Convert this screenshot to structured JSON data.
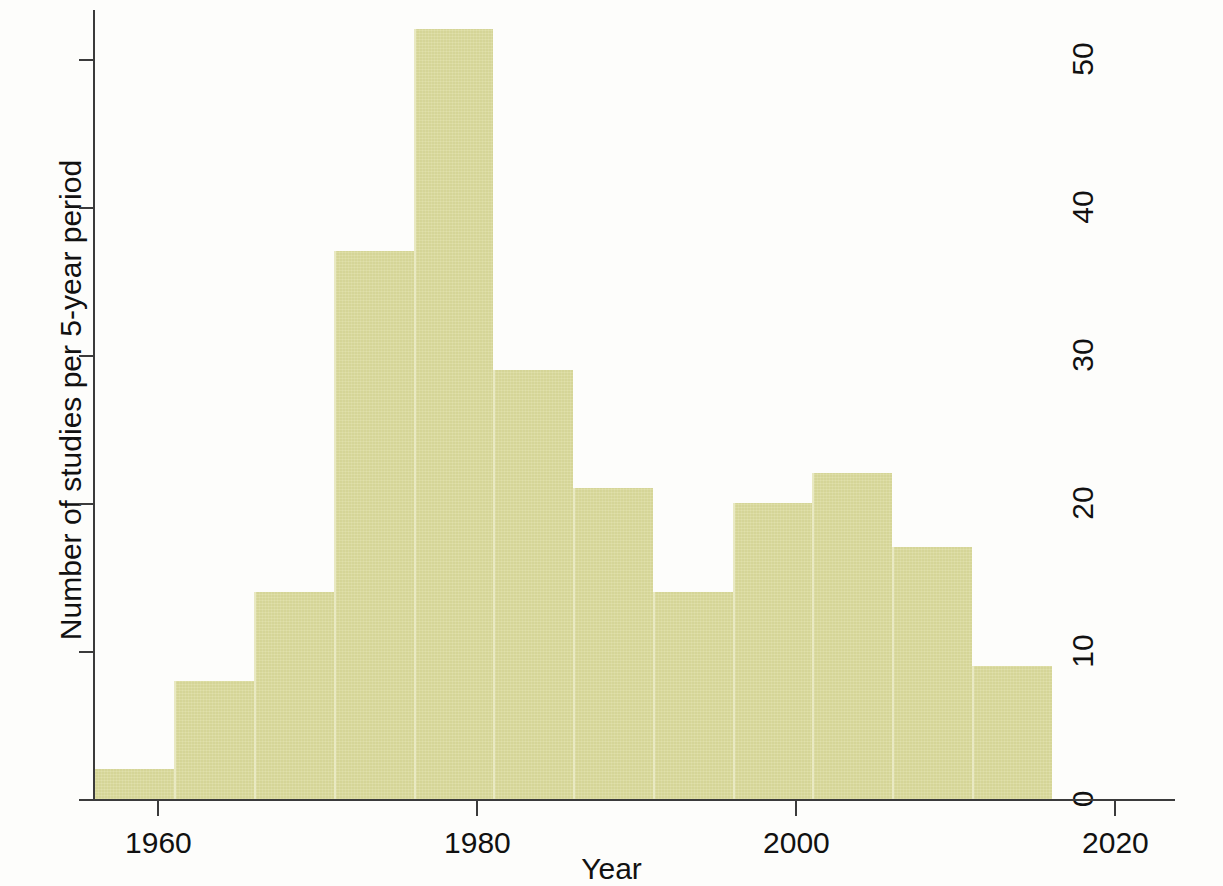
{
  "chart_data": {
    "type": "bar",
    "title": "",
    "xlabel": "Year",
    "ylabel": "Number of studies per 5-year period",
    "xlim": [
      1955.9,
      2016.3
    ],
    "ylim": [
      0,
      53
    ],
    "grid": false,
    "legend": null,
    "bin_width_years": 5,
    "categories": [
      "1956-1961",
      "1961-1966",
      "1966-1971",
      "1971-1976",
      "1976-1981",
      "1981-1986",
      "1986-1991",
      "1991-1996",
      "1996-2001",
      "2001-2006",
      "2006-2011",
      "2011-2016"
    ],
    "x": [
      1956,
      1961,
      1966,
      1971,
      1976,
      1981,
      1986,
      1991,
      1996,
      2001,
      2006,
      2011
    ],
    "values": [
      2,
      8,
      14,
      37,
      52,
      29,
      21,
      14,
      20,
      22,
      17,
      9
    ],
    "xticks": [
      1960,
      1980,
      2000,
      2020
    ],
    "xtick_labels": [
      "1960",
      "1980",
      "2000",
      "2020"
    ],
    "yticks": [
      0,
      10,
      20,
      30,
      40,
      50
    ],
    "ytick_labels": [
      "0",
      "10",
      "20",
      "30",
      "40",
      "50"
    ],
    "bar_color": "#d9d99a",
    "bar_edge_color": "#e9e9c2",
    "axis_color": "#3b3b3b",
    "background_color": "#fdfdfb"
  }
}
